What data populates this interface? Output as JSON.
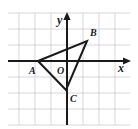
{
  "figure": {
    "kind": "coordinate-plane-triangle",
    "canvas": {
      "width": 138,
      "height": 129
    },
    "background_color": "#ffffff",
    "grid": {
      "visible": true,
      "color": "#cdcdd2",
      "spacing_px": 16,
      "x_start": 8,
      "x_end": 130,
      "y_start": 13,
      "y_end": 125,
      "line_width": 0.8
    },
    "axes": {
      "color": "#1a1a1a",
      "line_width": 2,
      "origin": {
        "x": 67,
        "y": 61
      },
      "x_axis": {
        "from_x": 8,
        "to_x": 130,
        "y": 61,
        "arrow": "right"
      },
      "y_axis": {
        "x": 67,
        "from_y": 125,
        "to_y": 13,
        "arrow": "up"
      },
      "x_label": "x",
      "y_label": "y",
      "x_label_pos": {
        "x": 118,
        "y": 72
      },
      "y_label_pos": {
        "x": 57,
        "y": 24
      }
    },
    "origin_label": {
      "text": "O",
      "x": 57,
      "y": 74
    },
    "triangle": {
      "stroke_color": "#1a1a1a",
      "stroke_width": 2,
      "fill": "none",
      "vertices": [
        {
          "name": "A",
          "px": {
            "x": 38,
            "y": 61
          },
          "label_pos": {
            "x": 29,
            "y": 74
          }
        },
        {
          "name": "B",
          "px": {
            "x": 87,
            "y": 41
          },
          "label_pos": {
            "x": 90,
            "y": 36
          }
        },
        {
          "name": "C",
          "px": {
            "x": 66,
            "y": 90
          },
          "label_pos": {
            "x": 70,
            "y": 102
          }
        }
      ]
    }
  }
}
